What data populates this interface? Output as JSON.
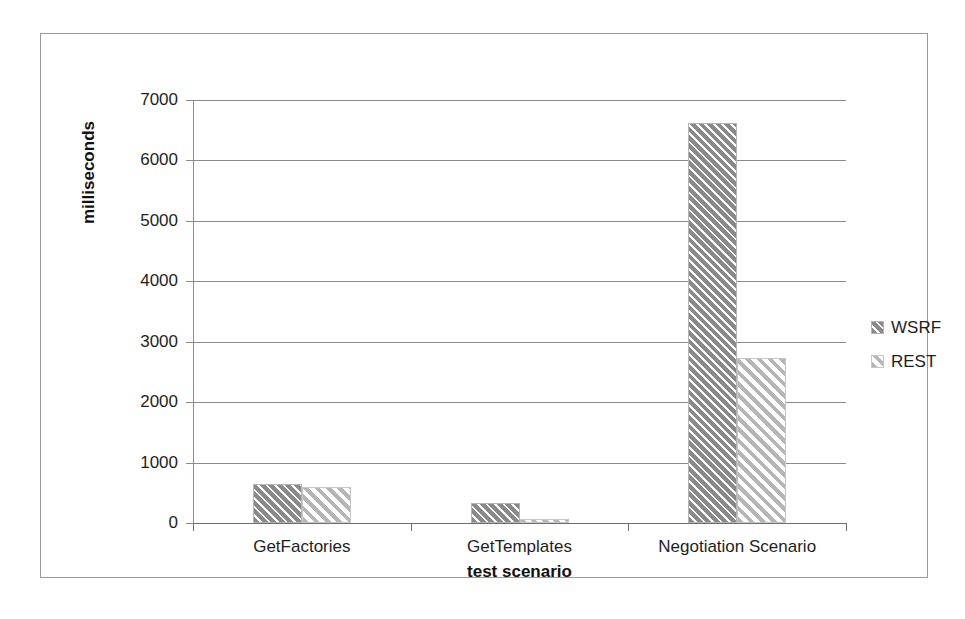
{
  "chart_data": {
    "type": "bar",
    "title": "",
    "xlabel": "test scenario",
    "ylabel": "milliseconds",
    "categories": [
      "GetFactories",
      "GetTemplates",
      "Negotiation Scenario"
    ],
    "series": [
      {
        "name": "WSRF",
        "values": [
          640,
          330,
          6620
        ],
        "swatch": "crosshatch-dark-gray",
        "color": "#8a8a8a"
      },
      {
        "name": "REST",
        "values": [
          590,
          65,
          2730
        ],
        "swatch": "diagonal-light-gray",
        "color": "#b6b6b6"
      }
    ],
    "ylim": [
      0,
      7000
    ],
    "yticks": [
      0,
      1000,
      2000,
      3000,
      4000,
      5000,
      6000,
      7000
    ],
    "ytick_labels": [
      "0",
      "1000",
      "2000",
      "3000",
      "4000",
      "5000",
      "6000",
      "7000"
    ],
    "grid": true,
    "grid_axis": "y",
    "legend_position": "right",
    "bar_gap_within_group": 0
  },
  "axis": {
    "ylabel": "milliseconds",
    "xlabel": "test scenario"
  },
  "legend": {
    "items": [
      {
        "label": "WSRF"
      },
      {
        "label": "REST"
      }
    ]
  }
}
